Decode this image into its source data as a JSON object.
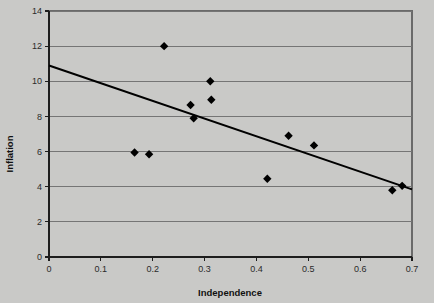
{
  "chart_data": {
    "type": "scatter",
    "title": "",
    "xlabel": "Independence",
    "ylabel": "Inflation",
    "xlim": [
      0,
      0.7
    ],
    "ylim": [
      0,
      14
    ],
    "xticks": [
      0,
      0.1,
      0.2,
      0.3,
      0.4,
      0.5,
      0.6,
      0.7
    ],
    "xticklabels": [
      "0",
      "0.1",
      "0.2",
      "0.3",
      "0.4",
      "0.5",
      "0.6",
      "0.7"
    ],
    "yticks": [
      0,
      2,
      4,
      6,
      8,
      10,
      12,
      14
    ],
    "yticklabels": [
      "0",
      "2",
      "4",
      "6",
      "8",
      "10",
      "12",
      "14"
    ],
    "grid": "horizontal",
    "legend": "none",
    "marker": "diamond",
    "marker_color": "#000000",
    "points": [
      {
        "x": 0.165,
        "y": 5.95
      },
      {
        "x": 0.193,
        "y": 5.85
      },
      {
        "x": 0.222,
        "y": 12.0
      },
      {
        "x": 0.273,
        "y": 8.65
      },
      {
        "x": 0.279,
        "y": 7.9
      },
      {
        "x": 0.311,
        "y": 10.0
      },
      {
        "x": 0.313,
        "y": 8.95
      },
      {
        "x": 0.421,
        "y": 4.45
      },
      {
        "x": 0.462,
        "y": 6.9
      },
      {
        "x": 0.511,
        "y": 6.35
      },
      {
        "x": 0.662,
        "y": 3.8
      },
      {
        "x": 0.681,
        "y": 4.05
      }
    ],
    "trendline": {
      "type": "linear",
      "x_start": 0.0,
      "y_start": 10.9,
      "x_end": 0.7,
      "y_end": 3.85
    }
  },
  "colors": {
    "background": "#c9c9c7",
    "gridline": "#757575",
    "axis": "#1d1d1d",
    "marker": "#000000",
    "trendline": "#000000",
    "plot_border": "#6a6a6a"
  }
}
